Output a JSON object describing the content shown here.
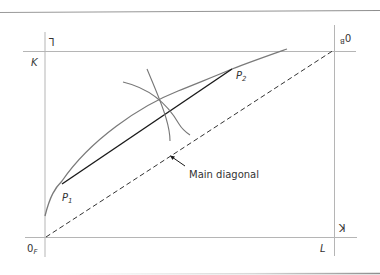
{
  "diagram": {
    "type": "edgeworth-box",
    "colors": {
      "axes": "#b5b5b5",
      "curve": "#7a7a7a",
      "segment": "#1a1a1a",
      "diagonal": "#333333",
      "rule": "#8e8e8e",
      "text": "#333333"
    },
    "labels": {
      "origin_bottom_left": "0",
      "origin_bottom_left_sub": "F",
      "origin_top_right": "0",
      "origin_top_right_sub": "B",
      "axis_left_top": "K",
      "axis_bottom_right": "L",
      "axis_top_left_flipped": "L",
      "axis_right_bottom_flipped": "K",
      "point_1": "P",
      "point_1_sub": "1",
      "point_2": "P",
      "point_2_sub": "2",
      "annotation": "Main diagonal"
    }
  }
}
